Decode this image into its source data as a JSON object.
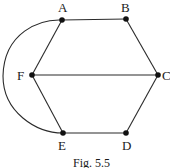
{
  "diagram": {
    "type": "graph",
    "caption": "Fig. 5.5",
    "nodes": [
      {
        "id": "A",
        "label": "A",
        "x": 62,
        "y": 20
      },
      {
        "id": "B",
        "label": "B",
        "x": 126,
        "y": 19
      },
      {
        "id": "C",
        "label": "C",
        "x": 158,
        "y": 75
      },
      {
        "id": "D",
        "label": "D",
        "x": 126,
        "y": 133
      },
      {
        "id": "E",
        "label": "E",
        "x": 63,
        "y": 133
      },
      {
        "id": "F",
        "label": "F",
        "x": 32,
        "y": 75
      }
    ],
    "edges": [
      {
        "from": "A",
        "to": "B",
        "kind": "straight"
      },
      {
        "from": "B",
        "to": "C",
        "kind": "straight"
      },
      {
        "from": "C",
        "to": "D",
        "kind": "straight"
      },
      {
        "from": "D",
        "to": "E",
        "kind": "straight"
      },
      {
        "from": "E",
        "to": "F",
        "kind": "straight"
      },
      {
        "from": "F",
        "to": "A",
        "kind": "straight"
      },
      {
        "from": "F",
        "to": "C",
        "kind": "straight"
      },
      {
        "from": "A",
        "to": "E",
        "kind": "curved-left"
      }
    ],
    "colors": {
      "edge": "#2a2a2a",
      "node": "#111111",
      "text": "#1a1a1a",
      "background": "#ffffff"
    }
  }
}
